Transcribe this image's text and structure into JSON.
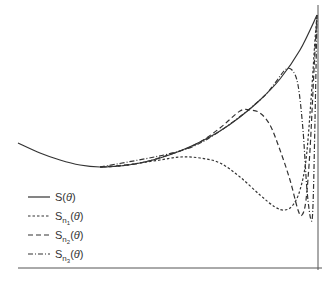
{
  "chart_data": {
    "type": "line",
    "title": "",
    "xlabel": "θ",
    "ylabel": "",
    "grid": false,
    "legend_position": "lower left",
    "legend": [
      "S(θ)",
      "S_n1(θ)",
      "S_n2(θ)",
      "S_n3(θ)"
    ],
    "series": [
      {
        "name": "S(θ)",
        "style": "solid",
        "points": [
          [
            18,
            143
          ],
          [
            40,
            153
          ],
          [
            60,
            160
          ],
          [
            80,
            165
          ],
          [
            100,
            167
          ],
          [
            120,
            166
          ],
          [
            140,
            163
          ],
          [
            160,
            158
          ],
          [
            180,
            151
          ],
          [
            200,
            142
          ],
          [
            220,
            131
          ],
          [
            240,
            117
          ],
          [
            260,
            100
          ],
          [
            280,
            79
          ],
          [
            300,
            50
          ],
          [
            317,
            15
          ]
        ]
      },
      {
        "name": "S_n1(θ)",
        "style": "short-dash",
        "points": [
          [
            100,
            167
          ],
          [
            120,
            166
          ],
          [
            140,
            163
          ],
          [
            160,
            160
          ],
          [
            180,
            157
          ],
          [
            200,
            158
          ],
          [
            220,
            163
          ],
          [
            240,
            177
          ],
          [
            260,
            195
          ],
          [
            275,
            207
          ],
          [
            285,
            210
          ],
          [
            293,
            205
          ],
          [
            300,
            190
          ],
          [
            306,
            160
          ],
          [
            311,
            100
          ],
          [
            315,
            40
          ],
          [
            317,
            15
          ]
        ]
      },
      {
        "name": "S_n2(θ)",
        "style": "long-dash",
        "points": [
          [
            100,
            167
          ],
          [
            140,
            163
          ],
          [
            180,
            151
          ],
          [
            200,
            142
          ],
          [
            220,
            128
          ],
          [
            240,
            111
          ],
          [
            250,
            110
          ],
          [
            260,
            113
          ],
          [
            270,
            125
          ],
          [
            280,
            150
          ],
          [
            290,
            180
          ],
          [
            298,
            210
          ],
          [
            302,
            215
          ],
          [
            306,
            200
          ],
          [
            310,
            150
          ],
          [
            314,
            70
          ],
          [
            317,
            15
          ]
        ]
      },
      {
        "name": "S_n3(θ)",
        "style": "dash-dot",
        "points": [
          [
            100,
            167
          ],
          [
            180,
            151
          ],
          [
            220,
            131
          ],
          [
            260,
            100
          ],
          [
            275,
            83
          ],
          [
            285,
            70
          ],
          [
            292,
            70
          ],
          [
            298,
            85
          ],
          [
            303,
            130
          ],
          [
            307,
            190
          ],
          [
            311,
            220
          ],
          [
            313,
            205
          ],
          [
            315,
            120
          ],
          [
            317,
            15
          ]
        ]
      }
    ],
    "axes": {
      "x_axis_y": 268,
      "y_axis_x": 318
    }
  },
  "legend": {
    "items": [
      {
        "base": "S",
        "sub": "",
        "subsub": "",
        "arg": "(θ)"
      },
      {
        "base": "S",
        "sub": "n",
        "subsub": "1",
        "arg": "(θ)"
      },
      {
        "base": "S",
        "sub": "n",
        "subsub": "2",
        "arg": "(θ)"
      },
      {
        "base": "S",
        "sub": "n",
        "subsub": "3",
        "arg": "(θ)"
      }
    ]
  }
}
